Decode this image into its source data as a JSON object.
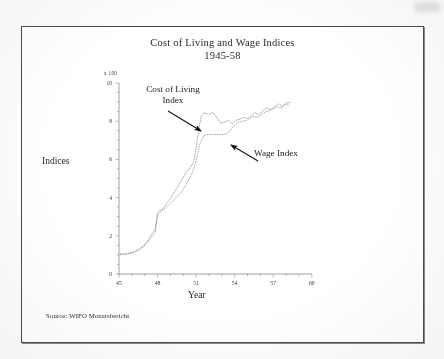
{
  "figure": {
    "title": "Cost of Living and Wage Indices",
    "subtitle": "1945-58",
    "source": "Source: WIFO Monatsbericht"
  },
  "annotations": {
    "cost_of_living": "Cost of Living\nIndex",
    "cost_of_living_line1": "Cost of Living",
    "cost_of_living_line2": "Index",
    "wage": "Wage Index"
  },
  "axes": {
    "y_unit": "x 100",
    "y_label": "Indices",
    "x_label": "Year",
    "y_ticks": [
      "0",
      "2",
      "4",
      "6",
      "8",
      "10"
    ],
    "x_ticks": [
      "45",
      "48",
      "51",
      "54",
      "57",
      "60"
    ]
  },
  "chart_data": {
    "type": "line",
    "title": "Cost of Living and Wage Indices 1945-58",
    "subtitle": "1945-58",
    "xlabel": "Year",
    "ylabel": "Indices",
    "y_unit": "x 100",
    "xlim": [
      45,
      60
    ],
    "ylim": [
      0,
      10
    ],
    "y_tick_values": [
      0,
      2,
      4,
      6,
      8,
      10
    ],
    "x_tick_values": [
      45,
      48,
      51,
      54,
      57,
      60
    ],
    "grid": false,
    "legend": "annotated-arrows",
    "source": "Source: WIFO Monatsbericht",
    "note": "Values are index points; axis is labelled in hundreds (x 100).",
    "series": [
      {
        "name": "Cost of Living Index",
        "annotation_position": "upper-left, arrow pointing down-right to 1951.5",
        "x": [
          45.1,
          45.4,
          45.7,
          46.0,
          46.3,
          46.6,
          46.9,
          47.2,
          47.5,
          47.8,
          48.0,
          48.2,
          48.4,
          48.7,
          49.0,
          49.3,
          49.6,
          49.9,
          50.2,
          50.5,
          50.8,
          51.0,
          51.2,
          51.4,
          51.6,
          51.8,
          52.0,
          52.3,
          52.6,
          52.9,
          53.2,
          53.5,
          53.8,
          54.1,
          54.4,
          54.7,
          55.0,
          55.3,
          55.6,
          55.9,
          56.2,
          56.5,
          56.8,
          57.1,
          57.4,
          57.7,
          58.0,
          58.3
        ],
        "y": [
          1.05,
          1.05,
          1.08,
          1.12,
          1.2,
          1.32,
          1.48,
          1.72,
          2.05,
          2.3,
          3.2,
          3.35,
          3.4,
          3.7,
          3.95,
          4.3,
          4.6,
          4.95,
          5.3,
          5.55,
          5.85,
          6.6,
          7.6,
          8.3,
          8.45,
          8.4,
          8.35,
          8.45,
          8.2,
          7.9,
          7.95,
          8.05,
          7.85,
          8.05,
          8.1,
          8.2,
          8.15,
          8.3,
          8.45,
          8.35,
          8.55,
          8.7,
          8.6,
          8.75,
          8.9,
          8.8,
          8.95,
          9.0
        ]
      },
      {
        "name": "Wage Index",
        "annotation_position": "lower-right, arrow pointing up-left to 1953",
        "x": [
          45.1,
          45.4,
          45.7,
          46.0,
          46.3,
          46.6,
          46.9,
          47.2,
          47.5,
          47.8,
          48.0,
          48.3,
          48.6,
          48.9,
          49.2,
          49.5,
          49.8,
          50.1,
          50.4,
          50.7,
          51.0,
          51.3,
          51.6,
          51.9,
          52.2,
          52.5,
          52.8,
          53.1,
          53.4,
          53.7,
          54.0,
          54.3,
          54.6,
          54.9,
          55.2,
          55.5,
          55.8,
          56.1,
          56.4,
          56.7,
          57.0,
          57.3,
          57.6,
          57.9,
          58.2
        ],
        "y": [
          1.02,
          1.02,
          1.05,
          1.1,
          1.18,
          1.28,
          1.42,
          1.62,
          1.9,
          2.15,
          3.1,
          3.3,
          3.45,
          3.65,
          3.85,
          4.05,
          4.25,
          4.55,
          4.9,
          5.3,
          5.95,
          6.85,
          7.25,
          7.3,
          7.3,
          7.3,
          7.3,
          7.3,
          7.35,
          7.55,
          7.8,
          7.95,
          8.0,
          8.05,
          8.15,
          8.25,
          8.2,
          8.35,
          8.5,
          8.55,
          8.65,
          8.75,
          8.7,
          8.85,
          8.9
        ]
      }
    ]
  },
  "colors": {
    "frame": "#4a4a4a",
    "ink": "#2a2a2a",
    "series_line": "#9a9a9a",
    "arrow": "#111111",
    "page": "#fdfdfd"
  }
}
